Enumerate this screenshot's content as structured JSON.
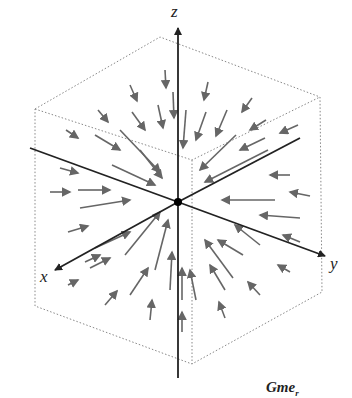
{
  "figure": {
    "axes": {
      "x_label": "x",
      "y_label": "y",
      "z_label": "z"
    },
    "caption_fragment": "Gme",
    "caption_subscript": "r",
    "colors": {
      "axis": "#222222",
      "arrow": "#666666",
      "cube": "#888888",
      "origin": "#000000"
    }
  }
}
